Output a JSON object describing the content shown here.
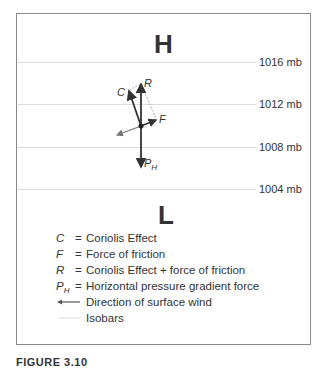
{
  "diagram": {
    "high_label": "H",
    "low_label": "L",
    "isobars": [
      {
        "value": "1016 mb",
        "y": 48
      },
      {
        "value": "1012 mb",
        "y": 90
      },
      {
        "value": "1008 mb",
        "y": 133
      },
      {
        "value": "1004 mb",
        "y": 175
      }
    ],
    "force_labels": {
      "C": "C",
      "R": "R",
      "F": "F",
      "PH_main": "P",
      "PH_sub": "H"
    },
    "colors": {
      "arrow": "#333333",
      "wind_arrow": "#777777",
      "isobar": "#dcdcdc",
      "dashed": "#999999",
      "border": "#8a8a8a"
    }
  },
  "legend": {
    "items": [
      {
        "symbol": "C",
        "equals": "=",
        "text": "Coriolis Effect"
      },
      {
        "symbol": "F",
        "equals": "=",
        "text": "Force of friction"
      },
      {
        "symbol": "R",
        "equals": "=",
        "text": "Coriolis Effect + force of friction"
      },
      {
        "symbol": "P",
        "symbol_sub": "H",
        "equals": "=",
        "text": "Horizontal pressure gradient force"
      }
    ],
    "wind_text": "Direction of surface wind",
    "isobars_text": "Isobars"
  },
  "caption": "FIGURE 3.10"
}
